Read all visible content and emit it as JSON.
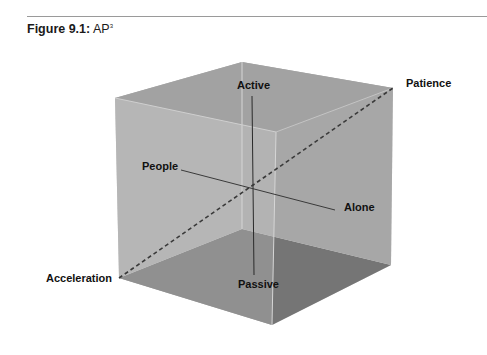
{
  "figure": {
    "caption_label": "Figure 9.1:",
    "caption_title": "AP",
    "caption_superscript": "3"
  },
  "diagram": {
    "type": "3d-cube",
    "colors": {
      "top_face": "#a4a4a4",
      "front_left_face": "#b4b4b4",
      "right_face": "#a8a8a8",
      "bottom_face": "#5a5a5a",
      "axis_line": "#2a2a2a",
      "edge_highlight": "#d8d8d8"
    },
    "labels": {
      "active": "Active",
      "passive": "Passive",
      "people": "People",
      "alone": "Alone",
      "patience": "Patience",
      "acceleration": "Acceleration"
    },
    "axes": [
      {
        "name": "activity-axis",
        "from": "Active",
        "to": "Passive",
        "style": "solid"
      },
      {
        "name": "social-axis",
        "from": "People",
        "to": "Alone",
        "style": "solid"
      },
      {
        "name": "tempo-axis",
        "from": "Acceleration",
        "to": "Patience",
        "style": "dashed"
      }
    ]
  }
}
